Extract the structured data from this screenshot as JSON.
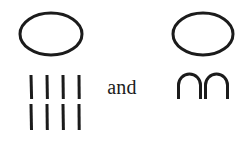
{
  "figure": {
    "background_color": "#ffffff",
    "ink_color": "#1b1b1b",
    "conjunction_label": "and",
    "left_group": {
      "name": "ellipse-over-tallies",
      "shape_label": "ellipse",
      "ellipse": {
        "center_x": 51,
        "center_y": 34,
        "radius_x": 31,
        "radius_y": 21,
        "stroke_width": 3
      },
      "tally_marks": {
        "label": "vertical-strokes",
        "rows": 2,
        "columns": 4,
        "total_count": 8,
        "stroke_width": 3,
        "mark_height": 24,
        "column_x": [
          31,
          47,
          63,
          79
        ],
        "row_y": [
          75,
          104
        ]
      }
    },
    "right_group": {
      "name": "ellipse-over-arches",
      "shape_label": "ellipse",
      "ellipse": {
        "center_x": 203,
        "center_y": 34,
        "radius_x": 30,
        "radius_y": 21,
        "stroke_width": 3
      },
      "arches": {
        "label": "arch-glyphs",
        "glyph": "∩",
        "count": 2,
        "stroke_width": 3,
        "width": 23,
        "height": 25,
        "left_x": [
          178,
          205
        ],
        "top_y": 74
      }
    }
  }
}
